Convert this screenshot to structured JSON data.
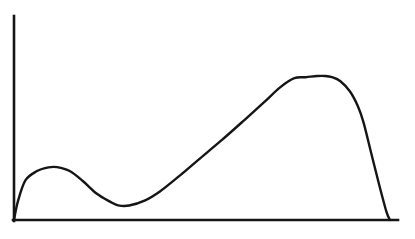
{
  "figure": {
    "background_color": "#ffffff",
    "ink_color": "#151515",
    "width": 415,
    "height": 239,
    "title": "",
    "caption": ""
  },
  "axes": {
    "origin": {
      "x": 14,
      "y": 220
    },
    "y_axis": {
      "x": 14,
      "y_top": 16,
      "y_bottom": 221,
      "label": "",
      "ticks": [],
      "tick_labels": []
    },
    "x_axis": {
      "y": 220,
      "x_left": 14,
      "x_right": 398,
      "label": "",
      "ticks": [],
      "tick_labels": []
    },
    "grid": false,
    "frame": "left-bottom-only",
    "arrowheads": false,
    "line_width": 2.6
  },
  "chart_data": {
    "type": "line",
    "title": "",
    "subtitle": "",
    "xlabel": "",
    "ylabel": "",
    "xlim": [
      0,
      1
    ],
    "ylim": [
      0,
      1
    ],
    "grid": false,
    "legend": null,
    "legend_position": "none",
    "series": [
      {
        "name": "curve",
        "color": "#151515",
        "line_width": 2.4,
        "marker": "none",
        "fill": "none",
        "description": "Bimodal curve: rises sharply from origin to a small local maximum, dips to a local minimum, climbs nearly linearly to a broad dominant maximum, then falls steeply back to the baseline before the right end of the axis.",
        "x": [
          0.0,
          0.01,
          0.03,
          0.06,
          0.09,
          0.112,
          0.145,
          0.18,
          0.215,
          0.25,
          0.271,
          0.3,
          0.34,
          0.38,
          0.43,
          0.48,
          0.54,
          0.6,
          0.65,
          0.693,
          0.73,
          0.76,
          0.79,
          0.81,
          0.828,
          0.85,
          0.875,
          0.895,
          0.91,
          0.93,
          0.95,
          0.97,
          0.979
        ],
        "y": [
          0.0,
          0.09,
          0.195,
          0.24,
          0.258,
          0.259,
          0.24,
          0.19,
          0.13,
          0.09,
          0.072,
          0.071,
          0.095,
          0.14,
          0.215,
          0.295,
          0.39,
          0.49,
          0.575,
          0.65,
          0.695,
          0.7,
          0.706,
          0.706,
          0.7,
          0.68,
          0.63,
          0.56,
          0.48,
          0.33,
          0.18,
          0.04,
          0.0
        ]
      }
    ],
    "annotations": [],
    "key_points": [
      {
        "name": "origin",
        "x": 0.0,
        "y": 0.0,
        "px": {
          "x": 14,
          "y": 220
        }
      },
      {
        "name": "local-maximum-1",
        "x": 0.112,
        "y": 0.259,
        "px": {
          "x": 57,
          "y": 167
        }
      },
      {
        "name": "local-minimum",
        "x": 0.271,
        "y": 0.071,
        "px": {
          "x": 118,
          "y": 206
        }
      },
      {
        "name": "global-maximum",
        "x": 0.8,
        "y": 0.706,
        "px": {
          "x": 315,
          "y": 75
        }
      },
      {
        "name": "right-baseline-crossing",
        "x": 0.979,
        "y": 0.0,
        "px": {
          "x": 390,
          "y": 220
        }
      }
    ]
  },
  "accessibility": {
    "alt_text": "Line graph on plain left and bottom axes showing a curve with a small early hump, a dip, a long steady rise to a broad rounded peak, then a steep drop back to the horizontal axis."
  }
}
